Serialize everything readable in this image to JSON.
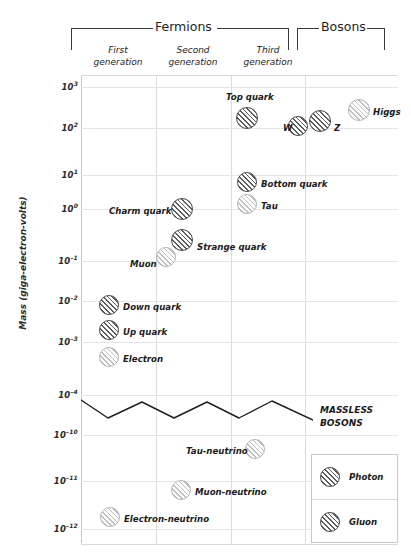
{
  "chart_data": {
    "type": "scatter",
    "title": "",
    "ylabel": "Mass (giga-electron-volts)",
    "xlabel": "",
    "grid": true,
    "y_ticks": [
      "10³",
      "10²",
      "10¹",
      "10⁰",
      "10⁻¹",
      "10⁻²",
      "10⁻³",
      "10⁻⁴",
      "10⁻¹⁰",
      "10⁻¹¹",
      "10⁻¹²"
    ],
    "y_tick_base": "10",
    "y_exponents": [
      "3",
      "2",
      "1",
      "0",
      "-1",
      "-2",
      "-3",
      "-4",
      "-10",
      "-11",
      "-12"
    ],
    "axis_break": true,
    "axis_break_note": "axis broken between 10⁻⁴ and 10⁻¹⁰ (zigzag line)",
    "columns": [
      "First generation",
      "Second generation",
      "Third generation",
      "Bosons"
    ],
    "groups": [
      {
        "name": "Fermions",
        "columns": [
          "First generation",
          "Second generation",
          "Third generation"
        ]
      },
      {
        "name": "Bosons",
        "columns": [
          "Bosons"
        ]
      }
    ],
    "massless_note": "MASSLESS BOSONS",
    "legend_position": "bottom-right",
    "legend": [
      {
        "label": "Photon",
        "style": "dark"
      },
      {
        "label": "Gluon",
        "style": "dark"
      }
    ],
    "points": [
      {
        "label": "Top quark",
        "column": "Third generation",
        "mass_gev": 173,
        "style": "dark",
        "label_side": "above"
      },
      {
        "label": "Higgs",
        "column": "Bosons",
        "mass_gev": 125,
        "style": "light",
        "label_side": "right"
      },
      {
        "label": "Z",
        "column": "Bosons",
        "mass_gev": 91,
        "style": "dark",
        "label_side": "right"
      },
      {
        "label": "W",
        "column": "Bosons",
        "mass_gev": 80,
        "style": "dark",
        "label_side": "left"
      },
      {
        "label": "Bottom quark",
        "column": "Third generation",
        "mass_gev": 4.2,
        "style": "dark",
        "label_side": "right"
      },
      {
        "label": "Tau",
        "column": "Third generation",
        "mass_gev": 1.78,
        "style": "light",
        "label_side": "right"
      },
      {
        "label": "Charm quark",
        "column": "Second generation",
        "mass_gev": 1.27,
        "style": "dark",
        "label_side": "left"
      },
      {
        "label": "Strange quark",
        "column": "Second generation",
        "mass_gev": 0.2,
        "style": "dark",
        "label_side": "right"
      },
      {
        "label": "Muon",
        "column": "Second generation",
        "mass_gev": 0.106,
        "style": "light",
        "label_side": "left"
      },
      {
        "label": "Down quark",
        "column": "First generation",
        "mass_gev": 0.0075,
        "style": "dark",
        "label_side": "right"
      },
      {
        "label": "Up quark",
        "column": "First generation",
        "mass_gev": 0.0028,
        "style": "dark",
        "label_side": "right"
      },
      {
        "label": "Electron",
        "column": "First generation",
        "mass_gev": 0.00051,
        "style": "light",
        "label_side": "right"
      },
      {
        "label": "Tau-neutrino",
        "column": "Third generation",
        "mass_gev": 4e-11,
        "style": "light",
        "label_side": "left"
      },
      {
        "label": "Muon-neutrino",
        "column": "Second generation",
        "mass_gev": 5e-12,
        "style": "light",
        "label_side": "right"
      },
      {
        "label": "Electron-neutrino",
        "column": "First generation",
        "mass_gev": 1.2e-12,
        "style": "light",
        "label_side": "right"
      }
    ]
  },
  "axis": {
    "ylabel": "Mass (giga-electron-volts)",
    "ticks": [
      {
        "exp": "3",
        "top": 86
      },
      {
        "exp": "2",
        "top": 127
      },
      {
        "exp": "1",
        "top": 174
      },
      {
        "exp": "0",
        "top": 208
      },
      {
        "exp": "-1",
        "top": 260
      },
      {
        "exp": "-2",
        "top": 300
      },
      {
        "exp": "-3",
        "top": 341
      },
      {
        "exp": "-4",
        "top": 394
      },
      {
        "exp": "-10",
        "top": 434
      },
      {
        "exp": "-11",
        "top": 480
      },
      {
        "exp": "-12",
        "top": 528
      }
    ]
  },
  "header": {
    "fermions": "Fermions",
    "bosons": "Bosons",
    "generations": [
      {
        "line1": "First",
        "line2": "generation"
      },
      {
        "line1": "Second",
        "line2": "generation"
      },
      {
        "line1": "Third",
        "line2": "generation"
      }
    ]
  },
  "annotations": {
    "massless_line1": "MASSLESS",
    "massless_line2": "BOSONS"
  },
  "legend": {
    "rows": [
      {
        "label": "Photon"
      },
      {
        "label": "Gluon"
      }
    ]
  },
  "particles": [
    {
      "label": "Top quark",
      "style": "dark",
      "cx": 247,
      "cy": 118,
      "r": 11,
      "lx": 226,
      "ly": 92,
      "side": "abs"
    },
    {
      "label": "Higgs",
      "style": "light",
      "cx": 359,
      "cy": 110,
      "r": 11,
      "lx": 373,
      "ly": 107,
      "side": "abs"
    },
    {
      "label": "Z",
      "style": "dark",
      "cx": 320,
      "cy": 121,
      "r": 11,
      "lx": 334,
      "ly": 123,
      "side": "abs"
    },
    {
      "label": "W",
      "style": "dark",
      "cx": 298,
      "cy": 126,
      "r": 10,
      "lx": 283,
      "ly": 123,
      "side": "abs"
    },
    {
      "label": "Bottom quark",
      "style": "dark",
      "cx": 247,
      "cy": 182,
      "r": 10,
      "lx": 261,
      "ly": 179,
      "side": "abs"
    },
    {
      "label": "Tau",
      "style": "light",
      "cx": 247,
      "cy": 204,
      "r": 10,
      "lx": 261,
      "ly": 201,
      "side": "abs"
    },
    {
      "label": "Charm quark",
      "style": "dark",
      "cx": 182,
      "cy": 209,
      "r": 11,
      "lx": 109,
      "ly": 206,
      "side": "abs"
    },
    {
      "label": "Strange quark",
      "style": "dark",
      "cx": 182,
      "cy": 240,
      "r": 11,
      "lx": 197,
      "ly": 242,
      "side": "abs"
    },
    {
      "label": "Muon",
      "style": "light",
      "cx": 166,
      "cy": 257,
      "r": 10,
      "lx": 130,
      "ly": 259,
      "side": "abs"
    },
    {
      "label": "Down quark",
      "style": "dark",
      "cx": 109,
      "cy": 305,
      "r": 10,
      "lx": 123,
      "ly": 302,
      "side": "abs"
    },
    {
      "label": "Up quark",
      "style": "dark",
      "cx": 109,
      "cy": 330,
      "r": 10,
      "lx": 123,
      "ly": 327,
      "side": "abs"
    },
    {
      "label": "Electron",
      "style": "light",
      "cx": 109,
      "cy": 357,
      "r": 10,
      "lx": 123,
      "ly": 354,
      "side": "abs"
    },
    {
      "label": "Tau-neutrino",
      "style": "light",
      "cx": 255,
      "cy": 449,
      "r": 10,
      "lx": 186,
      "ly": 446,
      "side": "abs"
    },
    {
      "label": "Muon-neutrino",
      "style": "light",
      "cx": 181,
      "cy": 490,
      "r": 10,
      "lx": 195,
      "ly": 487,
      "side": "abs"
    },
    {
      "label": "Electron-neutrino",
      "style": "light",
      "cx": 110,
      "cy": 517,
      "r": 10,
      "lx": 124,
      "ly": 514,
      "side": "abs"
    }
  ],
  "gridlines": {
    "vertical": [
      156,
      231,
      305
    ],
    "horizontal": [
      86,
      127,
      174,
      208,
      260,
      300,
      341,
      394,
      434,
      480,
      528
    ]
  }
}
